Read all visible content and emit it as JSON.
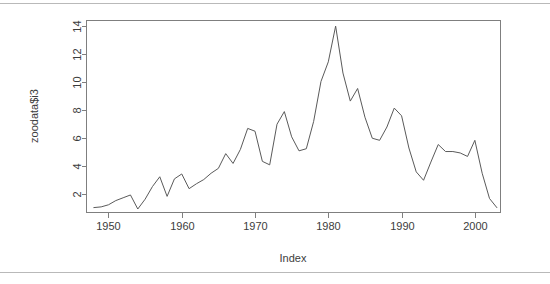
{
  "figure": {
    "background_color": "#ffffff",
    "frame_color": "#7f7f7f",
    "line_color": "#5a5a5a",
    "rule_color": "#b9b9b9",
    "text_color": "#3c3c3c"
  },
  "chart_data": {
    "type": "line",
    "title": "",
    "xlabel": "Index",
    "ylabel": "zoodata$i3",
    "xlim": [
      1947.0,
      2003.5
    ],
    "ylim": [
      0.7,
      14.4
    ],
    "xticks": [
      1950,
      1960,
      1970,
      1980,
      1990,
      2000
    ],
    "xtick_labels": [
      "1950",
      "1960",
      "1970",
      "1980",
      "1990",
      "2000"
    ],
    "yticks": [
      2,
      4,
      6,
      8,
      10,
      12,
      14
    ],
    "ytick_labels": [
      "2",
      "4",
      "6",
      "8",
      "10",
      "12",
      "14"
    ],
    "grid": false,
    "legend": null,
    "x": [
      1948,
      1949,
      1950,
      1951,
      1952,
      1953,
      1954,
      1955,
      1956,
      1957,
      1958,
      1959,
      1960,
      1961,
      1962,
      1963,
      1964,
      1965,
      1966,
      1967,
      1968,
      1969,
      1970,
      1971,
      1972,
      1973,
      1974,
      1975,
      1976,
      1977,
      1978,
      1979,
      1980,
      1981,
      1982,
      1983,
      1984,
      1985,
      1986,
      1987,
      1988,
      1989,
      1990,
      1991,
      1992,
      1993,
      1994,
      1995,
      1996,
      1997,
      1998,
      1999,
      2000,
      2001,
      2002,
      2003
    ],
    "values": [
      1.05,
      1.1,
      1.25,
      1.55,
      1.75,
      1.95,
      0.95,
      1.65,
      2.55,
      3.25,
      1.85,
      3.1,
      3.45,
      2.4,
      2.75,
      3.05,
      3.5,
      3.85,
      4.9,
      4.2,
      5.2,
      6.7,
      6.5,
      4.35,
      4.1,
      7.0,
      7.9,
      6.1,
      5.1,
      5.25,
      7.2,
      10.05,
      11.45,
      14.0,
      10.65,
      8.65,
      9.55,
      7.5,
      6.0,
      5.85,
      6.8,
      8.15,
      7.6,
      5.3,
      3.6,
      3.0,
      4.3,
      5.55,
      5.05,
      5.05,
      4.95,
      4.7,
      5.85,
      3.5,
      1.7,
      1.05
    ],
    "series_name": "zoodata$i3",
    "n_points": 56
  },
  "axes": {
    "x_axis_title": "Index",
    "y_axis_title": "zoodata$i3"
  }
}
